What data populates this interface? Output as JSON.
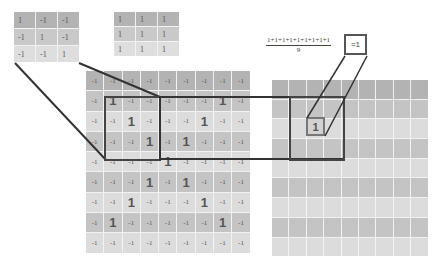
{
  "kernel_a": {
    "rows": [
      [
        "1",
        "-1",
        "-1"
      ],
      [
        "-1",
        "1",
        "-1"
      ],
      [
        "-1",
        "-1",
        "1"
      ]
    ]
  },
  "kernel_b": {
    "rows": [
      [
        "1",
        "1",
        "1"
      ],
      [
        "1",
        "1",
        "1"
      ],
      [
        "1",
        "1",
        "1"
      ]
    ]
  },
  "input_grid": {
    "rows": [
      [
        "-1",
        "-1",
        "-1",
        "-1",
        "-1",
        "-1",
        "-1",
        "-1",
        "-1"
      ],
      [
        "-1",
        "1",
        "-1",
        "-1",
        "-1",
        "-1",
        "-1",
        "1",
        "-1"
      ],
      [
        "-1",
        "-1",
        "1",
        "-1",
        "-1",
        "-1",
        "1",
        "-1",
        "-1"
      ],
      [
        "-1",
        "-1",
        "-1",
        "1",
        "-1",
        "1",
        "-1",
        "-1",
        "-1"
      ],
      [
        "-1",
        "-1",
        "-1",
        "-1",
        "1",
        "-1",
        "-1",
        "-1",
        "-1"
      ],
      [
        "-1",
        "-1",
        "-1",
        "1",
        "-1",
        "1",
        "-1",
        "-1",
        "-1"
      ],
      [
        "-1",
        "-1",
        "1",
        "-1",
        "-1",
        "-1",
        "1",
        "-1",
        "-1"
      ],
      [
        "-1",
        "1",
        "-1",
        "-1",
        "-1",
        "-1",
        "-1",
        "1",
        "-1"
      ],
      [
        "-1",
        "-1",
        "-1",
        "-1",
        "-1",
        "-1",
        "-1",
        "-1",
        "-1"
      ]
    ]
  },
  "output_grid": {
    "rows_count": 9,
    "cols_count": 9
  },
  "formula": {
    "numerator": "1+1+1+1+1+1+1+1+1",
    "denominator": "9",
    "result": "=1"
  },
  "output_value": "1",
  "colors": {
    "line": "#333333",
    "row_dark": "#b3b3b3",
    "row_mid": "#c9c9c9",
    "row_light": "#dedede"
  }
}
